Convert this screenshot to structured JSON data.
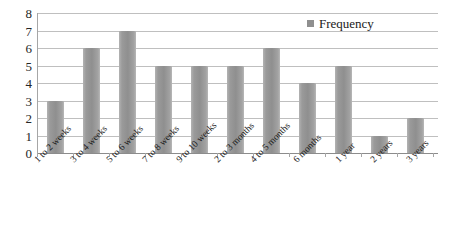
{
  "chart_data": {
    "type": "bar",
    "title": "",
    "xlabel": "",
    "ylabel": "",
    "ylim": [
      0,
      8
    ],
    "y_ticks": [
      8,
      7,
      6,
      5,
      4,
      3,
      2,
      1,
      0
    ],
    "grid": true,
    "legend_position": "top-right",
    "series": [
      {
        "name": "Frequency",
        "values": [
          3,
          6,
          7,
          5,
          5,
          5,
          6,
          4,
          5,
          1,
          2
        ]
      }
    ],
    "categories": [
      "1 to 2 weeks",
      "3 to 4 weeks",
      "5 to 6 weeks",
      "7 to 8 weeks",
      "9 to 10 weeks",
      "2 to 3 months",
      "4 to 5 months",
      "6 months",
      "1 year",
      "2 years",
      "3 years"
    ],
    "bar_color": "#8f8f8f",
    "gridline_color": "#bfbfbf",
    "axis_color": "#a6a6a6"
  },
  "legend": {
    "marker_name": "frequency-swatch",
    "label": "Frequency"
  },
  "caption": {
    "text": ""
  }
}
